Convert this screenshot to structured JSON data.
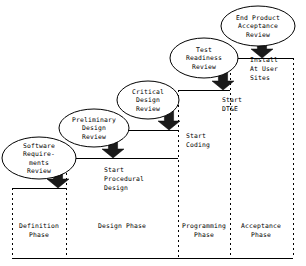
{
  "diagram": {
    "colors": {
      "line": "#000000",
      "arrow_fill": "#1a1a1a",
      "background": "#ffffff",
      "ellipse_fill": "#ffffff"
    },
    "milestones": [
      {
        "id": "software-requirements-review",
        "lines": [
          "Software",
          "Require-",
          "ments",
          "Review"
        ],
        "cx": 39,
        "cy": 158,
        "rx": 37,
        "ry": 21
      },
      {
        "id": "preliminary-design-review",
        "lines": [
          "Preliminary",
          "Design",
          "Review"
        ],
        "cx": 94,
        "cy": 128,
        "rx": 35,
        "ry": 19
      },
      {
        "id": "critical-design-review",
        "lines": [
          "Critical",
          "Design",
          "Review"
        ],
        "cx": 148,
        "cy": 100,
        "rx": 31,
        "ry": 19
      },
      {
        "id": "test-readiness-review",
        "lines": [
          "Test",
          "Readiness",
          "Review"
        ],
        "cx": 204,
        "cy": 58,
        "rx": 34,
        "ry": 20
      },
      {
        "id": "end-product-acceptance-review",
        "lines": [
          "End Product",
          "Acceptance",
          "Review"
        ],
        "cx": 258,
        "cy": 26,
        "rx": 37,
        "ry": 20
      }
    ],
    "activities": [
      {
        "id": "start-procedural-design",
        "lines": [
          "Start",
          "Procedural",
          "Design"
        ],
        "x": 104,
        "y": 172
      },
      {
        "id": "start-coding",
        "lines": [
          "Start",
          "Coding"
        ],
        "x": 186,
        "y": 138
      },
      {
        "id": "start-dt-and-e",
        "lines": [
          "Start",
          "DT&E"
        ],
        "x": 222,
        "y": 102
      },
      {
        "id": "install-at-user-sites",
        "lines": [
          "Install",
          "At User",
          "Sites"
        ],
        "x": 250,
        "y": 62
      }
    ],
    "arrows": [
      {
        "id": "arrow-to-definition-step",
        "cx": 58,
        "tip_y": 188,
        "top_y": 166
      },
      {
        "id": "arrow-to-design-step",
        "cx": 113,
        "tip_y": 158,
        "top_y": 136
      },
      {
        "id": "arrow-to-coding-step",
        "cx": 169,
        "tip_y": 130,
        "top_y": 108
      },
      {
        "id": "arrow-to-test-step",
        "cx": 223,
        "tip_y": 90,
        "top_y": 68
      },
      {
        "id": "arrow-to-acceptance-step",
        "cx": 262,
        "tip_y": 58,
        "top_y": 36
      }
    ],
    "steps": [
      {
        "id": "step-definition",
        "x1": 12,
        "x2": 66,
        "y": 188
      },
      {
        "id": "step-design",
        "x1": 66,
        "x2": 178,
        "y": 158
      },
      {
        "id": "step-coding",
        "x1": 122,
        "x2": 178,
        "y": 130
      },
      {
        "id": "step-programming",
        "x1": 178,
        "x2": 230,
        "y": 90
      },
      {
        "id": "step-acceptance",
        "x1": 230,
        "x2": 293,
        "y": 58
      }
    ],
    "dividers": [
      {
        "id": "divider-left-edge",
        "x": 12,
        "y1": 188,
        "y2": 258
      },
      {
        "id": "divider-definition-design",
        "x": 66,
        "y1": 158,
        "y2": 258
      },
      {
        "id": "divider-design-programming",
        "x": 178,
        "y1": 90,
        "y2": 258
      },
      {
        "id": "divider-programming-acceptance",
        "x": 230,
        "y1": 58,
        "y2": 258
      },
      {
        "id": "divider-right-edge",
        "x": 293,
        "y1": 58,
        "y2": 258
      }
    ],
    "baselines": [
      {
        "id": "baseline-definition",
        "x1": 12,
        "x2": 66,
        "y": 258
      },
      {
        "id": "baseline-design",
        "x1": 66,
        "x2": 178,
        "y": 258
      },
      {
        "id": "baseline-programming",
        "x1": 178,
        "x2": 230,
        "y": 258
      },
      {
        "id": "baseline-acceptance",
        "x1": 230,
        "x2": 293,
        "y": 258
      }
    ],
    "phases": [
      {
        "id": "definition-phase",
        "lines": [
          "Definition",
          "Phase"
        ],
        "cx": 39,
        "y": 228
      },
      {
        "id": "design-phase",
        "lines": [
          "Design Phase"
        ],
        "cx": 122,
        "y": 228
      },
      {
        "id": "programming-phase",
        "lines": [
          "Programming",
          "Phase"
        ],
        "cx": 204,
        "y": 228
      },
      {
        "id": "acceptance-phase",
        "lines": [
          "Acceptance",
          "Phase"
        ],
        "cx": 261,
        "y": 228
      }
    ]
  }
}
